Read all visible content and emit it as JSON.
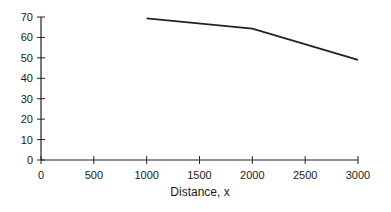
{
  "chart_data": {
    "type": "line",
    "title": "",
    "xlabel": "Distance, x",
    "ylabel": "",
    "x_ticks": [
      0,
      500,
      1000,
      1500,
      2000,
      2500,
      3000
    ],
    "y_ticks": [
      0,
      10,
      20,
      30,
      40,
      50,
      60,
      70
    ],
    "xlim": [
      0,
      3000
    ],
    "ylim": [
      0,
      70
    ],
    "grid": false,
    "legend": null,
    "series": [
      {
        "name": "series-1",
        "x": [
          1000,
          2000,
          3000
        ],
        "y": [
          69.3,
          64.3,
          49
        ]
      }
    ],
    "line_color": "#222222"
  }
}
